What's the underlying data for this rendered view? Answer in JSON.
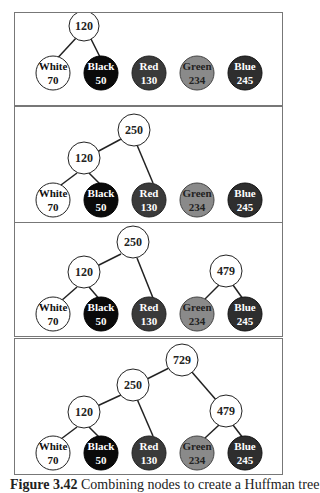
{
  "colors": {
    "white_node": "#ffffff",
    "black_node": "#0a0a0a",
    "red_node": "#3a3a3a",
    "green_node": "#8a8a8a",
    "blue_node": "#2e2e2e",
    "internal_node": "#ffffff",
    "edge": "#222222",
    "panel_border": "#777777"
  },
  "leaves": [
    {
      "id": "white",
      "label": "White",
      "weight": "70"
    },
    {
      "id": "black",
      "label": "Black",
      "weight": "50"
    },
    {
      "id": "red",
      "label": "Red",
      "weight": "130"
    },
    {
      "id": "green",
      "label": "Green",
      "weight": "234"
    },
    {
      "id": "blue",
      "label": "Blue",
      "weight": "245"
    }
  ],
  "panels": [
    {
      "step": 1,
      "internal_nodes": [
        {
          "id": "n120",
          "value": "120",
          "children": [
            "white",
            "black"
          ]
        }
      ]
    },
    {
      "step": 2,
      "internal_nodes": [
        {
          "id": "n120",
          "value": "120",
          "children": [
            "white",
            "black"
          ]
        },
        {
          "id": "n250",
          "value": "250",
          "children": [
            "n120",
            "red"
          ]
        }
      ]
    },
    {
      "step": 3,
      "internal_nodes": [
        {
          "id": "n120",
          "value": "120",
          "children": [
            "white",
            "black"
          ]
        },
        {
          "id": "n250",
          "value": "250",
          "children": [
            "n120",
            "red"
          ]
        },
        {
          "id": "n479",
          "value": "479",
          "children": [
            "green",
            "blue"
          ]
        }
      ]
    },
    {
      "step": 4,
      "internal_nodes": [
        {
          "id": "n120",
          "value": "120",
          "children": [
            "white",
            "black"
          ]
        },
        {
          "id": "n250",
          "value": "250",
          "children": [
            "n120",
            "red"
          ]
        },
        {
          "id": "n479",
          "value": "479",
          "children": [
            "green",
            "blue"
          ]
        },
        {
          "id": "n729",
          "value": "729",
          "children": [
            "n250",
            "n479"
          ]
        }
      ]
    }
  ],
  "caption": {
    "label": "Figure 3.42",
    "text": "Combining nodes to create a Huffman tree"
  }
}
